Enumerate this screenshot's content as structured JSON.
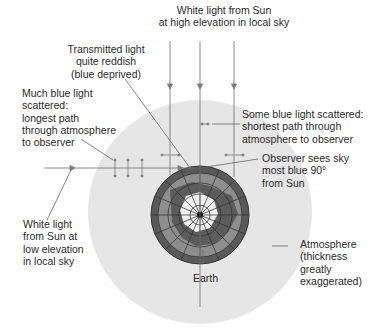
{
  "diagram": {
    "colors": {
      "background": "#ffffff",
      "atmosphere": "#e6e6e6",
      "earth_dark": "#4a4a4a",
      "earth_mid": "#8a8a8a",
      "earth_light": "#f0f0f0",
      "ray": "#7a7a7a",
      "leader": "#666666",
      "text": "#2a2a2a"
    },
    "labels": {
      "sun_high": [
        "White light from Sun",
        "at high elevation in local sky"
      ],
      "transmitted": [
        "Transmitted light",
        "quite reddish",
        "(blue deprived)"
      ],
      "much_blue": [
        "Much blue light",
        "scattered:",
        "longest path",
        "through atmosphere",
        "to observer"
      ],
      "some_blue": [
        "Some blue light scattered:",
        "shortest path through",
        "atmosphere to observer"
      ],
      "observer": [
        "Observer sees sky",
        "most blue 90°",
        "from Sun"
      ],
      "sun_low": [
        "White light",
        "from Sun at",
        "low elevation",
        "in local sky"
      ],
      "atmosphere": [
        "Atmosphere",
        "(thickness",
        "greatly",
        "exaggerated)"
      ],
      "earth": [
        "Earth"
      ]
    }
  }
}
